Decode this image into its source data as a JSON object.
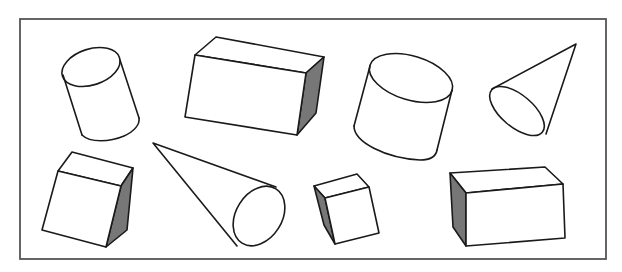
{
  "figure": {
    "description": "Line drawing of eight 3D geometric solids inside a rectangular frame",
    "frame": {
      "x": 20,
      "y": 19,
      "width": 586,
      "height": 240,
      "stroke": "#555555"
    },
    "colors": {
      "line": "#1a1a1a",
      "shaded_face": "#777777",
      "background": "#ffffff"
    },
    "shapes": [
      {
        "id": "cylinder-1",
        "type": "cylinder",
        "position": "top-left"
      },
      {
        "id": "box-1",
        "type": "rectangular-prism",
        "position": "top-center-left",
        "shaded_side": "right"
      },
      {
        "id": "cylinder-2",
        "type": "cylinder",
        "position": "top-center-right"
      },
      {
        "id": "cone-1",
        "type": "cone",
        "position": "top-right"
      },
      {
        "id": "cube-1",
        "type": "cube",
        "position": "bottom-left",
        "shaded_side": "right"
      },
      {
        "id": "cone-2",
        "type": "cone",
        "position": "bottom-center-left"
      },
      {
        "id": "cube-2",
        "type": "cube",
        "position": "bottom-center-right",
        "shaded_side": "left"
      },
      {
        "id": "box-2",
        "type": "rectangular-prism",
        "position": "bottom-right",
        "shaded_side": "left"
      }
    ]
  }
}
